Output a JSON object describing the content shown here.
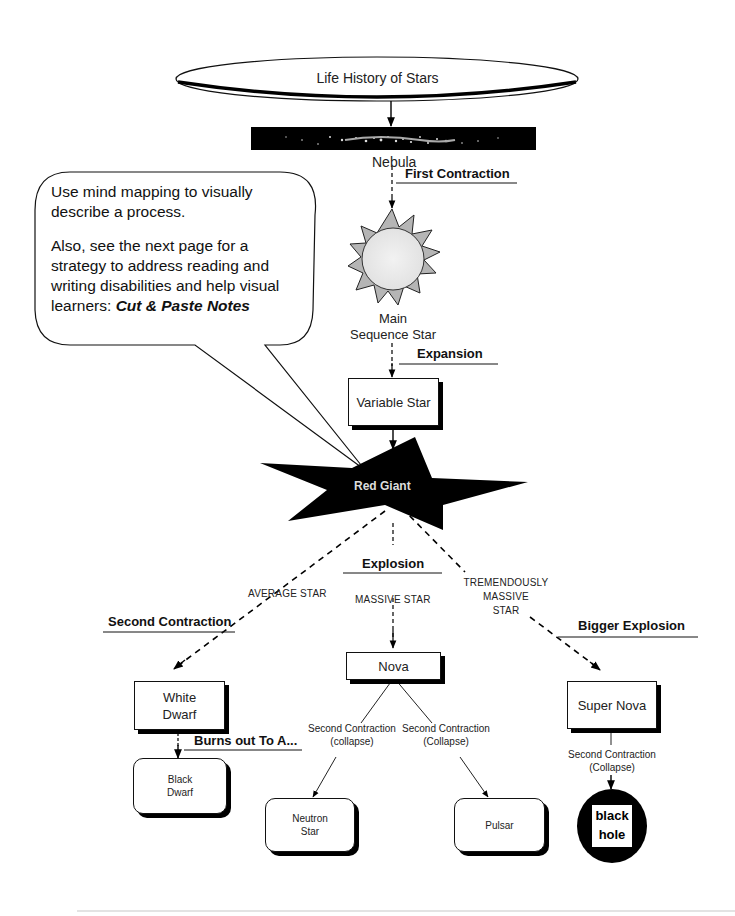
{
  "diagram": {
    "title": "Life History of Stars",
    "nodes": {
      "nebula": "Nebula",
      "main_sequence": [
        "Main",
        "Sequence Star"
      ],
      "variable_star": "Variable Star",
      "red_giant": "Red Giant",
      "nova": "Nova",
      "white_dwarf": [
        "White",
        "Dwarf"
      ],
      "black_dwarf": [
        "Black",
        "Dwarf"
      ],
      "neutron_star": [
        "Neutron",
        "Star"
      ],
      "pulsar": "Pulsar",
      "super_nova": "Super Nova",
      "black_hole": [
        "black",
        "hole"
      ]
    },
    "process_labels": {
      "first_contraction": "First Contraction",
      "expansion": "Expansion",
      "explosion": "Explosion",
      "second_contraction": "Second Contraction",
      "bigger_explosion": "Bigger Explosion",
      "burns_out": "Burns out To A..."
    },
    "branch_labels": {
      "average_star": "AVERAGE STAR",
      "massive_star": "MASSIVE STAR",
      "tremendously_massive": [
        "TREMENDOUSLY",
        "MASSIVE",
        "STAR"
      ]
    },
    "edge_labels": {
      "nova_left": [
        "Second Contraction",
        "(collapse)"
      ],
      "nova_right": [
        "Second Contraction",
        "(Collapse)"
      ],
      "super_nova": [
        "Second Contraction",
        "(Collapse)"
      ]
    }
  },
  "callout": {
    "line1": "Use mind mapping to visually",
    "line2": "describe a process.",
    "line3": "Also, see the next page for a",
    "line4": "strategy to address reading and",
    "line5": "writing disabilities and help visual",
    "line6_prefix": "learners: ",
    "line6_emphasis": "Cut & Paste Notes"
  }
}
